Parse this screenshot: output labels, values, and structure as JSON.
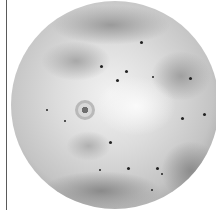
{
  "image": {
    "subject": "Io, moon of Jupiter",
    "description": "Grayscale full-disk view of Io showing volcanic surface with dark hotspots and a ring-shaped plume deposit",
    "colors": {
      "background": "#ffffff",
      "left_line": "#5a5a5a",
      "surface_light": "#f2f2f2",
      "surface_mid": "#c4c4c4",
      "limb_dark": "#6a6a6a",
      "hotspot": "#222222"
    }
  }
}
